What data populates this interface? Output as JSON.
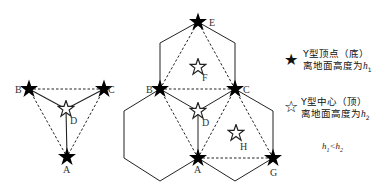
{
  "diagram": {
    "left_figure": {
      "points": {
        "A": {
          "label": "A",
          "type": "bottom-vertex"
        },
        "B": {
          "label": "B",
          "type": "bottom-vertex"
        },
        "C": {
          "label": "C",
          "type": "bottom-vertex"
        },
        "D": {
          "label": "D",
          "type": "top-center"
        }
      }
    },
    "right_figure": {
      "points": {
        "A": {
          "label": "A",
          "type": "bottom-vertex"
        },
        "B": {
          "label": "B",
          "type": "bottom-vertex"
        },
        "C": {
          "label": "C",
          "type": "bottom-vertex"
        },
        "D": {
          "label": "D",
          "type": "top-center"
        },
        "E": {
          "label": "E",
          "type": "bottom-vertex"
        },
        "F": {
          "label": "F",
          "type": "top-center"
        },
        "G": {
          "label": "G",
          "type": "bottom-vertex"
        },
        "H": {
          "label": "H",
          "type": "top-center"
        }
      }
    }
  },
  "legend": {
    "vertex": {
      "icon": "filled-star-icon",
      "symbol": "★",
      "line1": "Y型顶点（底）",
      "line2": "离地面高度为",
      "var": "h",
      "sub": "1"
    },
    "center": {
      "icon": "hollow-star-icon",
      "symbol": "☆",
      "line1": "Y型中心（顶）",
      "line2": "离地面高度为",
      "var": "h",
      "sub": "2"
    },
    "condition": {
      "lhs": "h",
      "lhs_sub": "1",
      "op": "<",
      "rhs": "h",
      "rhs_sub": "2"
    }
  },
  "colors": {
    "line": "#222222",
    "star_fill": "#000000",
    "background": "#ffffff"
  }
}
